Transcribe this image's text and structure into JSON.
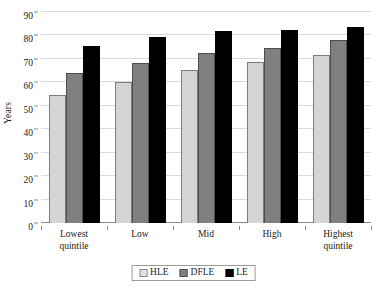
{
  "chart_data": {
    "type": "bar",
    "title": "",
    "xlabel": "",
    "ylabel": "Years",
    "ylim": [
      0,
      90
    ],
    "ytick_step": 10,
    "yticks": [
      0,
      10,
      20,
      30,
      40,
      50,
      60,
      70,
      80,
      90
    ],
    "grid": true,
    "legend_position": "bottom",
    "categories": [
      "Lowest quintile",
      "Low",
      "Mid",
      "High",
      "Highest quintile"
    ],
    "category_lines": [
      [
        "Lowest",
        "quintile"
      ],
      [
        "Low",
        ""
      ],
      [
        "Mid",
        ""
      ],
      [
        "High",
        ""
      ],
      [
        "Highest",
        "quintile"
      ]
    ],
    "series": [
      {
        "name": "HLE",
        "color": "#d4d4d4",
        "values": [
          54.5,
          60.0,
          65.2,
          68.7,
          71.7
        ]
      },
      {
        "name": "DFLE",
        "color": "#808080",
        "values": [
          64.0,
          68.2,
          72.4,
          74.5,
          78.0
        ]
      },
      {
        "name": "LE",
        "color": "#000000",
        "values": [
          75.4,
          79.4,
          81.8,
          82.3,
          83.5
        ]
      }
    ]
  },
  "legend": {
    "items": [
      {
        "label": "HLE",
        "swatch": "legend-swatch-hle"
      },
      {
        "label": "DFLE",
        "swatch": "legend-swatch-dfle"
      },
      {
        "label": "LE",
        "swatch": "legend-swatch-le"
      }
    ]
  },
  "colors": {
    "hle": "#d4d4d4",
    "dfle": "#808080",
    "le": "#000000",
    "gridline": "#d9d9d9",
    "axis": "#8a8a8a",
    "text": "#1a1a1a"
  }
}
